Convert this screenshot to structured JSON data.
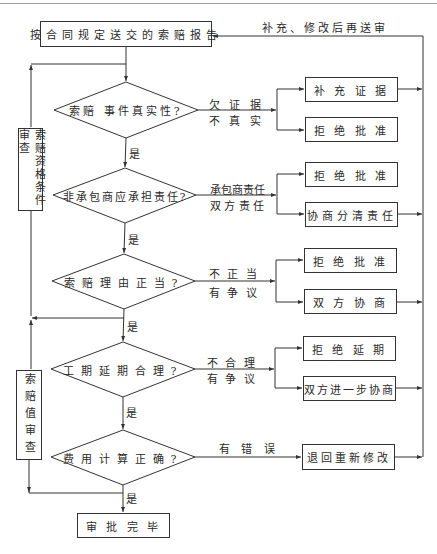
{
  "start": {
    "label": "按合同规定送交的索赔报告"
  },
  "feedback": {
    "label": "补充、修改后再送审"
  },
  "side_boxes": [
    {
      "label": "索赔资格条件审查"
    },
    {
      "label": "索赔值审查"
    }
  ],
  "decisions": [
    {
      "question": "索赔 事件真实性?",
      "branch_label_1": "欠 证 据",
      "branch_label_2": "不 真 实",
      "outcomes": [
        "补 充 证 据",
        "拒 绝 批 准"
      ],
      "yes_label": "是"
    },
    {
      "question": "非承包商应承担责任?",
      "branch_label_1": "承包商责任",
      "branch_label_2": "双 方 责 任",
      "outcomes": [
        "拒 绝 批 准",
        "协商分清责任"
      ],
      "yes_label": "是"
    },
    {
      "question": "索赔理由正当?",
      "branch_label_1": "不 正 当",
      "branch_label_2": "有 争 议",
      "outcomes": [
        "拒 绝 批 准",
        "双 方 协 商"
      ],
      "yes_label": "是"
    },
    {
      "question": "工期延期合理?",
      "branch_label_1": "不 合 理",
      "branch_label_2": "有 争 议",
      "outcomes": [
        "拒 绝 延 期",
        "双方进一步协商"
      ],
      "yes_label": "是"
    },
    {
      "question": "费用计算正确?",
      "branch_label_1": "有 错 误",
      "outcomes": [
        "退回重新修改"
      ],
      "yes_label": "是"
    }
  ],
  "end": {
    "label": "审 批 完 毕"
  }
}
